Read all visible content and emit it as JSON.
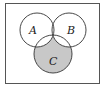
{
  "diagram": {
    "type": "venn",
    "universe": {
      "label": "",
      "border_color": "#555555"
    },
    "sets": [
      {
        "label": "A",
        "cx": 37,
        "cy": 30,
        "r": 17
      },
      {
        "label": "B",
        "cx": 69,
        "cy": 30,
        "r": 17
      },
      {
        "label": "C",
        "cx": 53,
        "cy": 54,
        "r": 19
      }
    ],
    "shaded_region": "C only (C minus A and B)",
    "colors": {
      "shade": "#c8c8c8",
      "stroke": "#333333",
      "background": "#ffffff"
    }
  }
}
